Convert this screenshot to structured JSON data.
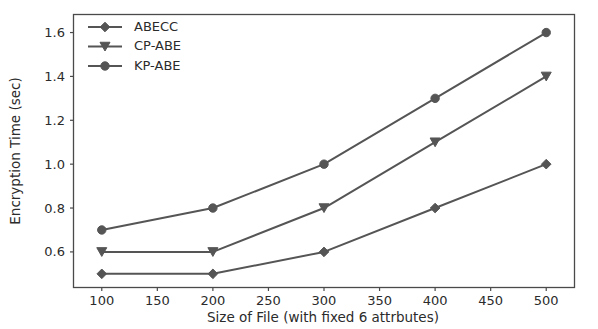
{
  "chart_data": {
    "type": "line",
    "title": "",
    "xlabel": "Size of File (with fixed 6 attrbutes)",
    "ylabel": "Encryption Time (sec)",
    "x": [
      100,
      200,
      300,
      400,
      500
    ],
    "xlim": [
      75,
      525
    ],
    "ylim": [
      0.44,
      1.68
    ],
    "xticks": [
      100,
      150,
      200,
      250,
      300,
      350,
      400,
      450,
      500
    ],
    "xticklabels": [
      "100",
      "150",
      "200",
      "250",
      "300",
      "350",
      "400",
      "450",
      "500"
    ],
    "yticks": [
      0.6,
      0.8,
      1.0,
      1.2,
      1.4,
      1.6
    ],
    "yticklabels": [
      "0.6",
      "0.8",
      "1.0",
      "1.2",
      "1.4",
      "1.6"
    ],
    "grid": false,
    "legend_position": "upper left",
    "line_color": "#555555",
    "series": [
      {
        "name": "ABECC",
        "marker": "diamond",
        "values": [
          0.5,
          0.5,
          0.6,
          0.8,
          1.0
        ]
      },
      {
        "name": "CP-ABE",
        "marker": "triangle-down",
        "values": [
          0.6,
          0.6,
          0.8,
          1.1,
          1.4
        ]
      },
      {
        "name": "KP-ABE",
        "marker": "circle",
        "values": [
          0.7,
          0.8,
          1.0,
          1.3,
          1.6
        ]
      }
    ]
  },
  "legend": {
    "entries": [
      {
        "label": "ABECC"
      },
      {
        "label": "CP-ABE"
      },
      {
        "label": "KP-ABE"
      }
    ]
  },
  "axes": {
    "y_title": "Encryption Time (sec)",
    "x_title": "Size of File (with fixed 6 attrbutes)"
  }
}
